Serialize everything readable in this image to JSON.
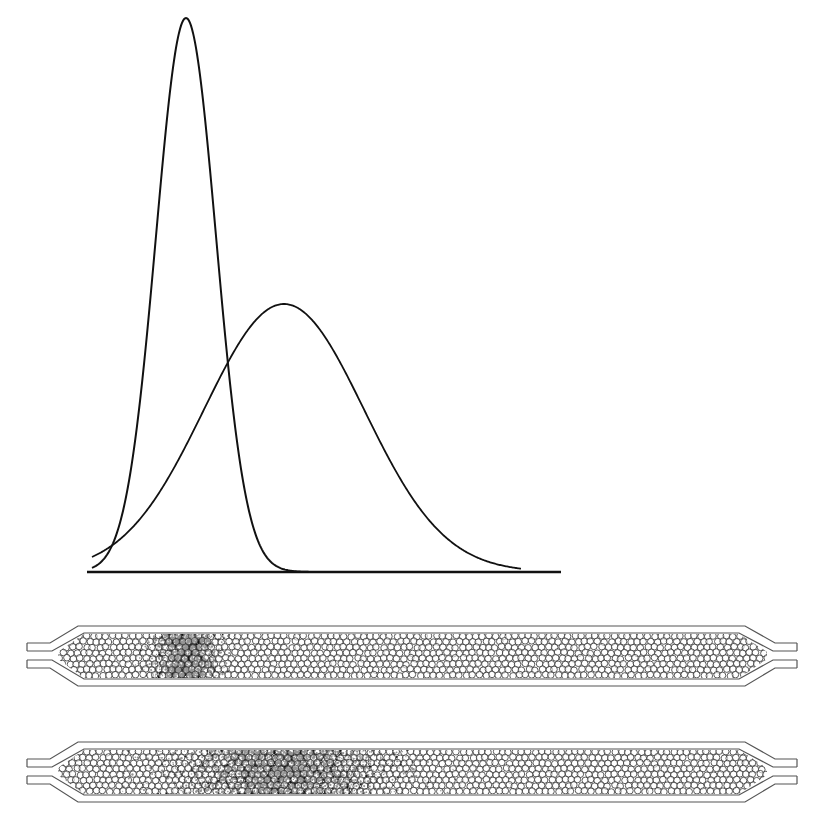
{
  "figure": {
    "title": "Chromatographic band broadening: elution peaks and packed columns",
    "colors": {
      "ink": "#111111",
      "background": "#ffffff",
      "column_wall": "#555555",
      "bead": "#333333"
    }
  },
  "chart": {
    "baseline": {
      "x_start": 87,
      "x_end": 561,
      "y": 572
    },
    "peaks": [
      {
        "name": "narrow-peak",
        "center_x": 186,
        "height": 554,
        "sigma": 30
      },
      {
        "name": "broad-peak",
        "center_x": 284,
        "height": 268,
        "sigma": 80
      }
    ]
  },
  "columns": [
    {
      "name": "column-early",
      "top": 626,
      "band_center_x": 185,
      "band_width": 40,
      "band_intensity": 0.9
    },
    {
      "name": "column-late",
      "top": 742,
      "band_center_x": 282,
      "band_width": 130,
      "band_intensity": 0.6
    }
  ],
  "column_geometry": {
    "tube_left_x": 27,
    "taper_left_start": 50,
    "body_left_x": 78,
    "body_right_x": 745,
    "taper_right_end": 775,
    "tube_right_x": 797,
    "outer_height": 60,
    "wall_thickness": 7,
    "tube_top_offset": 17,
    "tube_height": 8,
    "tube_gap": 9
  },
  "chart_data": {
    "type": "line",
    "title": "",
    "xlabel": "",
    "ylabel": "",
    "grid": false,
    "legend": null,
    "x_range_px": [
      87,
      561
    ],
    "series": [
      {
        "name": "Narrow (early) band",
        "shape": "gaussian",
        "peak_x_px": 186,
        "peak_height_px": 554,
        "fwhm_px": 70
      },
      {
        "name": "Broad (later) band",
        "shape": "gaussian",
        "peak_x_px": 284,
        "peak_height_px": 268,
        "fwhm_px": 190
      }
    ],
    "annotations": [
      {
        "text": "curves intersect",
        "x_px": 225,
        "y_px": 380
      }
    ]
  }
}
